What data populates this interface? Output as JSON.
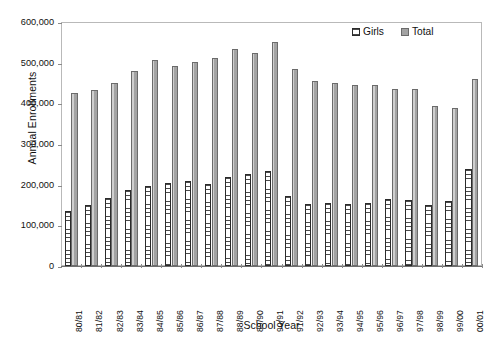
{
  "chart_data": {
    "type": "bar",
    "title": "",
    "xlabel": "School Year",
    "ylabel": "Annual Enrollments",
    "ylim": [
      0,
      600000
    ],
    "ytick_step": 100000,
    "ytick_labels": [
      "600,000",
      "500,000",
      "400,000",
      "300,000",
      "200,000",
      "100,000",
      "0"
    ],
    "ytick_values": [
      600000,
      500000,
      400000,
      300000,
      200000,
      100000,
      0
    ],
    "grid": false,
    "legend_position": "top-right",
    "categories": [
      "80/81",
      "81/82",
      "82/83",
      "83/84",
      "84/85",
      "85/86",
      "86/87",
      "87/88",
      "88/89",
      "89/90",
      "90/91",
      "91/92",
      "92/93",
      "93/94",
      "94/95",
      "95/96",
      "96/97",
      "97/98",
      "98/99",
      "99/00",
      "00/01"
    ],
    "series": [
      {
        "name": "Girls",
        "values": [
          136000,
          151000,
          167000,
          188000,
          197000,
          203000,
          208000,
          202000,
          218000,
          226000,
          234000,
          171000,
          152000,
          156000,
          153000,
          156000,
          164000,
          163000,
          151000,
          160000,
          239000
        ]
      },
      {
        "name": "Total",
        "values": [
          425000,
          433000,
          450000,
          479000,
          506000,
          491000,
          502000,
          511000,
          534000,
          525000,
          551000,
          485000,
          456000,
          451000,
          444000,
          446000,
          436000,
          436000,
          394000,
          389000,
          459000
        ]
      }
    ],
    "colors": {
      "girls_fill": "#ffffff",
      "girls_border": "#2b2b2b",
      "total_fill": "#a3a3a3",
      "total_border": "#6b6b6b",
      "frame": "#b9b9b9",
      "axis": "#6f6f6f",
      "text": "#111111"
    }
  },
  "legend": {
    "entries": [
      {
        "label": "Girls",
        "swatch": "girls-swatch-icon"
      },
      {
        "label": "Total",
        "swatch": "total-swatch-icon"
      }
    ]
  },
  "axis_titles": {
    "x": "School Year",
    "y": "Annual Enrollments"
  }
}
